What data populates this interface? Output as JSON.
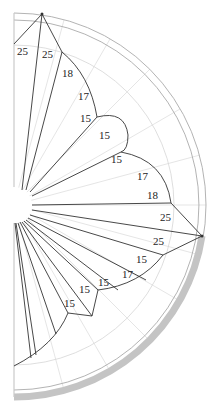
{
  "diagram": {
    "type": "half-polar sector diagram",
    "center": [
      14,
      205
    ],
    "colors": {
      "outline": "#333333",
      "grid": "#d9d9d9",
      "band": "#c8c8c8",
      "ring": "#aaaaaa"
    },
    "labels": [
      {
        "id": "l1",
        "text": "25",
        "x": 17,
        "y": 55
      },
      {
        "id": "l2",
        "text": "25",
        "x": 42,
        "y": 58
      },
      {
        "id": "l3",
        "text": "18",
        "x": 62,
        "y": 77
      },
      {
        "id": "l4",
        "text": "17",
        "x": 78,
        "y": 100
      },
      {
        "id": "l5",
        "text": "15",
        "x": 80,
        "y": 122
      },
      {
        "id": "l6",
        "text": "15",
        "x": 99,
        "y": 139
      },
      {
        "id": "l7",
        "text": "15",
        "x": 111,
        "y": 163
      },
      {
        "id": "l8",
        "text": "17",
        "x": 137,
        "y": 180
      },
      {
        "id": "l9",
        "text": "18",
        "x": 147,
        "y": 199
      },
      {
        "id": "l10",
        "text": "25",
        "x": 160,
        "y": 221
      },
      {
        "id": "l11",
        "text": "25",
        "x": 153,
        "y": 245
      },
      {
        "id": "l12",
        "text": "15",
        "x": 136,
        "y": 263
      },
      {
        "id": "l13",
        "text": "17",
        "x": 122,
        "y": 278
      },
      {
        "id": "l14",
        "text": "15",
        "x": 98,
        "y": 286
      },
      {
        "id": "l15",
        "text": "15",
        "x": 79,
        "y": 293
      },
      {
        "id": "l16",
        "text": "15",
        "x": 64,
        "y": 307
      }
    ]
  }
}
